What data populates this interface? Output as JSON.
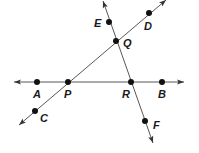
{
  "diagram": {
    "type": "geometry-lines",
    "lines": [
      {
        "name": "line AB",
        "through": [
          "A",
          "P",
          "R",
          "B"
        ],
        "x1": 14,
        "y1": 82,
        "x2": 184,
        "y2": 82
      },
      {
        "name": "line CD",
        "through": [
          "C",
          "P",
          "Q",
          "D"
        ],
        "x1": 19,
        "y1": 125,
        "x2": 166,
        "y2": 0
      },
      {
        "name": "line EF",
        "through": [
          "E",
          "Q",
          "R",
          "F"
        ],
        "x1": 103,
        "y1": 1,
        "x2": 153,
        "y2": 143
      }
    ],
    "points": [
      {
        "label": "A",
        "x": 37,
        "y": 82,
        "lx": 33,
        "ly": 98
      },
      {
        "label": "P",
        "x": 68,
        "y": 82,
        "lx": 64,
        "ly": 98
      },
      {
        "label": "R",
        "x": 131,
        "y": 82,
        "lx": 122,
        "ly": 98
      },
      {
        "label": "B",
        "x": 162,
        "y": 82,
        "lx": 158,
        "ly": 98
      },
      {
        "label": "Q",
        "x": 116,
        "y": 41,
        "lx": 123,
        "ly": 47
      },
      {
        "label": "E",
        "x": 109,
        "y": 22,
        "lx": 94,
        "ly": 27
      },
      {
        "label": "D",
        "x": 149,
        "y": 13,
        "lx": 144,
        "ly": 30
      },
      {
        "label": "C",
        "x": 35,
        "y": 111,
        "lx": 40,
        "ly": 122
      },
      {
        "label": "F",
        "x": 145,
        "y": 121,
        "lx": 153,
        "ly": 129
      }
    ]
  }
}
